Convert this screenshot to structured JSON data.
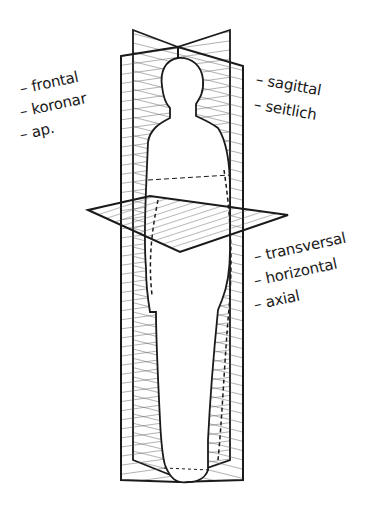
{
  "figure": {
    "colors": {
      "line": "#1a1a1a",
      "hatch": "#444444",
      "background": "#ffffff"
    }
  },
  "labels": {
    "frontal_group": [
      "– frontal",
      "– koronar",
      "– ap."
    ],
    "sagittal_group": [
      "– sagittal",
      "– seitlich"
    ],
    "transverse_group": [
      "– transversal",
      "– horizontal",
      "– axial"
    ]
  }
}
